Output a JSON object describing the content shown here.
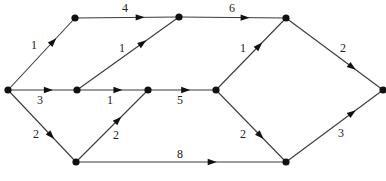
{
  "diagram": {
    "type": "directed-weighted-graph",
    "nodes": [
      {
        "id": "s",
        "x": 8,
        "y": 90
      },
      {
        "id": "a",
        "x": 75,
        "y": 18
      },
      {
        "id": "b",
        "x": 77,
        "y": 90
      },
      {
        "id": "c",
        "x": 76,
        "y": 162
      },
      {
        "id": "d",
        "x": 179,
        "y": 17
      },
      {
        "id": "e",
        "x": 148,
        "y": 90
      },
      {
        "id": "f",
        "x": 286,
        "y": 18
      },
      {
        "id": "g",
        "x": 216,
        "y": 90
      },
      {
        "id": "h",
        "x": 286,
        "y": 162
      },
      {
        "id": "t",
        "x": 383,
        "y": 90
      }
    ],
    "edges": [
      {
        "from": "s",
        "to": "a",
        "weight": "1",
        "label_x": 34,
        "label_y": 49,
        "arrow_t": 0.72
      },
      {
        "from": "s",
        "to": "b",
        "weight": "3",
        "label_x": 40,
        "label_y": 104,
        "arrow_t": 0.65
      },
      {
        "from": "s",
        "to": "c",
        "weight": "2",
        "label_x": 36,
        "label_y": 138,
        "arrow_t": 0.68
      },
      {
        "from": "a",
        "to": "d",
        "weight": "4",
        "label_x": 125,
        "label_y": 12,
        "arrow_t": 0.67
      },
      {
        "from": "b",
        "to": "d",
        "weight": "1",
        "label_x": 122,
        "label_y": 52,
        "arrow_t": 0.68
      },
      {
        "from": "b",
        "to": "e",
        "weight": "1",
        "label_x": 110,
        "label_y": 104,
        "arrow_t": 0.64
      },
      {
        "from": "c",
        "to": "e",
        "weight": "2",
        "label_x": 116,
        "label_y": 139,
        "arrow_t": 0.63
      },
      {
        "from": "c",
        "to": "h",
        "weight": "8",
        "label_x": 180,
        "label_y": 158,
        "arrow_t": 0.67
      },
      {
        "from": "d",
        "to": "f",
        "weight": "6",
        "label_x": 232,
        "label_y": 12,
        "arrow_t": 0.66
      },
      {
        "from": "e",
        "to": "g",
        "weight": "5",
        "label_x": 180,
        "label_y": 104,
        "arrow_t": 0.62
      },
      {
        "from": "g",
        "to": "f",
        "weight": "1",
        "label_x": 243,
        "label_y": 52,
        "arrow_t": 0.66
      },
      {
        "from": "g",
        "to": "h",
        "weight": "2",
        "label_x": 243,
        "label_y": 138,
        "arrow_t": 0.68
      },
      {
        "from": "f",
        "to": "t",
        "weight": "2",
        "label_x": 343,
        "label_y": 52,
        "arrow_t": 0.72
      },
      {
        "from": "h",
        "to": "t",
        "weight": "3",
        "label_x": 341,
        "label_y": 137,
        "arrow_t": 0.72
      }
    ],
    "colors": {
      "line": "#3a3a3a",
      "node": "#111111",
      "label": "#222222",
      "background": "#ffffff"
    }
  }
}
